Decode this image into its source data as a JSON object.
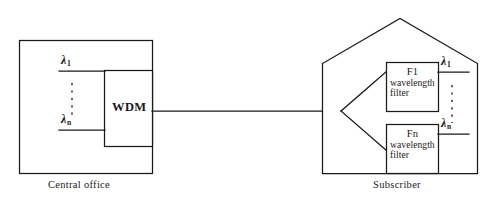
{
  "diagram": {
    "type": "wdm-optical-network",
    "central_office": {
      "caption": "Central office",
      "wdm_label": "WDM",
      "inputs": [
        {
          "symbol": "λ",
          "subscript": "1"
        },
        {
          "symbol": "λ",
          "subscript": "n"
        }
      ],
      "vertical_ellipsis": "⋮"
    },
    "subscriber": {
      "caption": "Subscriber",
      "filters": [
        {
          "name": "F1",
          "desc_line1": "wavelength",
          "desc_line2": "filter",
          "output": {
            "symbol": "λ",
            "subscript": "1"
          }
        },
        {
          "name": "Fn",
          "desc_line1": "wavelength",
          "desc_line2": "filter",
          "output": {
            "symbol": "λ",
            "subscript": "n"
          }
        }
      ],
      "vertical_ellipsis": "⋮"
    },
    "colors": {
      "stroke": "#1a1a1a",
      "background": "#ffffff",
      "text": "#1a1a1a"
    }
  }
}
